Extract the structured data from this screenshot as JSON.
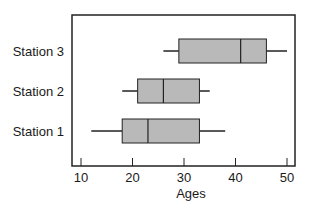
{
  "chart_data": {
    "type": "boxplot",
    "orientation": "horizontal",
    "title": "",
    "xlabel": "Ages",
    "ylabel": "",
    "xlim": [
      8.5,
      51.5
    ],
    "xticks": [
      10,
      20,
      30,
      40,
      50
    ],
    "xtick_labels": [
      "10",
      "20",
      "30",
      "40",
      "50"
    ],
    "grid": false,
    "legend": null,
    "categories": [
      "Station 1",
      "Station 2",
      "Station 3"
    ],
    "series": [
      {
        "name": "Station 1",
        "min": 12,
        "q1": 18,
        "median": 23,
        "q3": 33,
        "max": 38
      },
      {
        "name": "Station 2",
        "min": 18,
        "q1": 21,
        "median": 26,
        "q3": 33,
        "max": 35
      },
      {
        "name": "Station 3",
        "min": 26,
        "q1": 29,
        "median": 41,
        "q3": 46,
        "max": 50
      }
    ],
    "colors": {
      "box_fill": "#b9b9b9",
      "stroke": "#222222",
      "frame": "#222222"
    }
  }
}
